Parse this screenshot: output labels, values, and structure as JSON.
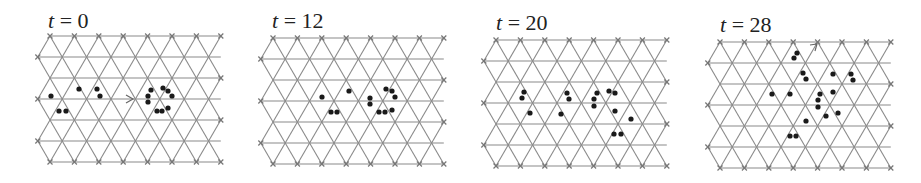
{
  "figure": {
    "colors": {
      "grid": "#8a8a8a",
      "dot": "#1a1a1a",
      "text": "#222222"
    },
    "lattice": {
      "rows": 7,
      "cols": 8,
      "dx": 24.4,
      "dy": 21
    },
    "panels": [
      {
        "label_var": "t",
        "label_eq": " = ",
        "label_val": "0",
        "label_x": 48,
        "label_y": 28,
        "origin": [
          50,
          36
        ],
        "arrow": {
          "x": 133,
          "y": 99,
          "dir": "right"
        },
        "dots": [
          [
            51,
            96
          ],
          [
            79,
            89
          ],
          [
            97,
            89
          ],
          [
            100,
            96
          ],
          [
            59,
            111
          ],
          [
            66,
            111
          ],
          [
            151,
            90
          ],
          [
            148,
            96
          ],
          [
            148,
            102
          ],
          [
            163,
            88
          ],
          [
            168,
            91
          ],
          [
            172,
            96
          ],
          [
            157,
            111
          ],
          [
            162,
            111
          ],
          [
            168,
            108
          ]
        ]
      },
      {
        "label_var": "t",
        "label_eq": " = ",
        "label_val": "12",
        "label_x": 272,
        "label_y": 28,
        "origin": [
          273,
          38
        ],
        "arrow": null,
        "dots": [
          [
            322,
            97
          ],
          [
            349,
            91
          ],
          [
            331,
            112
          ],
          [
            337,
            112
          ],
          [
            370,
            98
          ],
          [
            370,
            104
          ],
          [
            386,
            89
          ],
          [
            392,
            91
          ],
          [
            395,
            97
          ],
          [
            379,
            112
          ],
          [
            385,
            112
          ],
          [
            392,
            110
          ]
        ]
      },
      {
        "label_var": "t",
        "label_eq": " = ",
        "label_val": "20",
        "label_x": 496,
        "label_y": 30,
        "origin": [
          496,
          40
        ],
        "arrow": null,
        "dots": [
          [
            524,
            92
          ],
          [
            522,
            98
          ],
          [
            530,
            113
          ],
          [
            567,
            93
          ],
          [
            569,
            99
          ],
          [
            561,
            114
          ],
          [
            597,
            93
          ],
          [
            594,
            99
          ],
          [
            594,
            106
          ],
          [
            609,
            91
          ],
          [
            615,
            93
          ],
          [
            615,
            111
          ],
          [
            631,
            119
          ],
          [
            614,
            134
          ],
          [
            621,
            134
          ]
        ]
      },
      {
        "label_var": "t",
        "label_eq": " = ",
        "label_val": "28",
        "label_x": 720,
        "label_y": 32,
        "origin": [
          720,
          42
        ],
        "arrow": {
          "x": 817,
          "y": 44,
          "dir": "up-right"
        },
        "dots": [
          [
            797,
            53
          ],
          [
            794,
            58
          ],
          [
            803,
            73
          ],
          [
            806,
            79
          ],
          [
            833,
            74
          ],
          [
            851,
            74
          ],
          [
            853,
            80
          ],
          [
            772,
            94
          ],
          [
            790,
            94
          ],
          [
            820,
            94
          ],
          [
            818,
            100
          ],
          [
            818,
            107
          ],
          [
            833,
            92
          ],
          [
            838,
            113
          ],
          [
            826,
            116
          ],
          [
            806,
            121
          ],
          [
            790,
            136
          ],
          [
            796,
            136
          ]
        ]
      }
    ]
  }
}
